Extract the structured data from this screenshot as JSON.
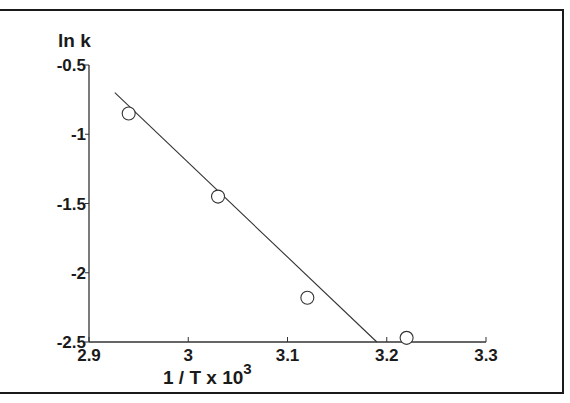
{
  "chart_data": {
    "type": "scatter",
    "title": "",
    "xlabel": "1 / T x 10",
    "xlabel_superscript": "3",
    "ylabel": "ln k",
    "xlim": [
      2.9,
      3.3
    ],
    "ylim": [
      -2.5,
      -0.5
    ],
    "x_ticks": [
      "2.9",
      "3",
      "3.1",
      "3.2",
      "3.3"
    ],
    "y_ticks": [
      "-0.5",
      "-1",
      "-1.5",
      "-2",
      "-2.5"
    ],
    "grid": false,
    "legend": null,
    "series": [
      {
        "name": "data",
        "marker": "open-circle",
        "x": [
          2.94,
          3.03,
          3.12,
          3.22
        ],
        "y": [
          -0.85,
          -1.45,
          -2.18,
          -2.47
        ]
      },
      {
        "name": "linear fit",
        "style": "line",
        "x": [
          2.926,
          3.19
        ],
        "y": [
          -0.7,
          -2.5
        ]
      }
    ]
  }
}
